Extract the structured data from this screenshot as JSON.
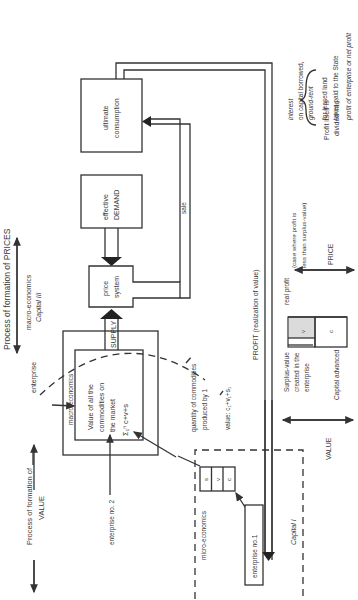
{
  "diagram": {
    "orientation": "rotated-90-ccw",
    "prices_axis": {
      "label": "Process of formation of PRICES",
      "sub1": "macro-economics",
      "sub2": "Capital III"
    },
    "value_axis": {
      "label1": "Process of formation of",
      "label2": "VALUE"
    },
    "boxes": {
      "ultimate_consumption": {
        "line1": "ultimate",
        "line2": "consumption"
      },
      "effective_demand": {
        "line1": "effective",
        "line2": "DEMAND"
      },
      "price_system": {
        "line1": "price",
        "line2": "system"
      },
      "macro_box": {
        "header": "macro-economics",
        "line1": "Value of all the",
        "line2": "commodities on",
        "line3": "the market",
        "formula": "Σ₁ⁿ c+v+s"
      },
      "enterprise_no1": "enterprise no.1"
    },
    "labels": {
      "supply": "SUPPLY",
      "sale": "sale",
      "enterprise": "enterprise",
      "enterprise_no2": "enterprise no. 2",
      "profit": "PROFIT (realization of value)",
      "micro_economics": "micro-economics",
      "capital_i": "Capital I",
      "quantity_line1": "quantity of commodities",
      "quantity_line2": "produced by 1",
      "quantity_value": "value: c₁+v₁+s₁"
    },
    "micro_cells": [
      "s",
      "v",
      "c"
    ],
    "bar": {
      "cells": [
        "v",
        "c"
      ],
      "real_profit": "real profit",
      "surplus_line1": "Surplus-value",
      "surplus_line2": "created in the",
      "surplus_line3": "enterprise",
      "capital_advanced": "Capital advanced",
      "value_label": "VALUE",
      "price_label": "PRICE",
      "case_line1": "(case where profit is",
      "case_line2": "less than surplus-value)"
    },
    "profit_division": {
      "intro1": "Profit itself is",
      "intro2": "divided into:",
      "items": [
        "interest",
        "on capital borrowed,",
        "ground-rent",
        "for leased land",
        "taxes paid to the State",
        "profit of enterprise or net profit"
      ]
    }
  }
}
